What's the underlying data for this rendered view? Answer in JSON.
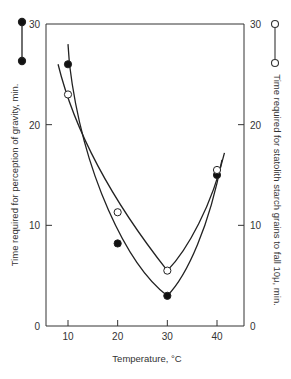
{
  "chart_data": {
    "type": "line",
    "title": "",
    "xlabel": "Temperature, °C",
    "ylabel_left": "Time required for perception of gravity, min.",
    "ylabel_right": "Time required for statolith starch grains to fall 10μ, min.",
    "x_ticks": [
      10,
      20,
      30,
      40
    ],
    "y_ticks_left": [
      0,
      10,
      20,
      30
    ],
    "y_ticks_right": [
      0,
      10,
      20,
      30
    ],
    "xlim": [
      5,
      45
    ],
    "ylim": [
      0,
      30
    ],
    "grid": false,
    "legend": [
      {
        "marker": "filled-circle",
        "axis": "left",
        "label": "Time required for perception of gravity, min."
      },
      {
        "marker": "open-circle",
        "axis": "right",
        "label": "Time required for statolith starch grains to fall 10μ, min."
      }
    ],
    "series": [
      {
        "name": "Perception of gravity (filled)",
        "axis": "left",
        "marker": "filled-circle",
        "x": [
          10,
          20,
          30,
          40
        ],
        "values": [
          26,
          8.2,
          3,
          15
        ]
      },
      {
        "name": "Statolith fall 10μ (open)",
        "axis": "right",
        "marker": "open-circle",
        "x": [
          10,
          20,
          30,
          40
        ],
        "values": [
          23,
          11.3,
          5.5,
          15.5
        ]
      }
    ]
  },
  "labels": {
    "xlabel": "Temperature, °C",
    "ylabel_left": "Time required for perception of gravity, min.",
    "ylabel_right": "Time required for statolith starch grains to fall 10μ, min."
  }
}
